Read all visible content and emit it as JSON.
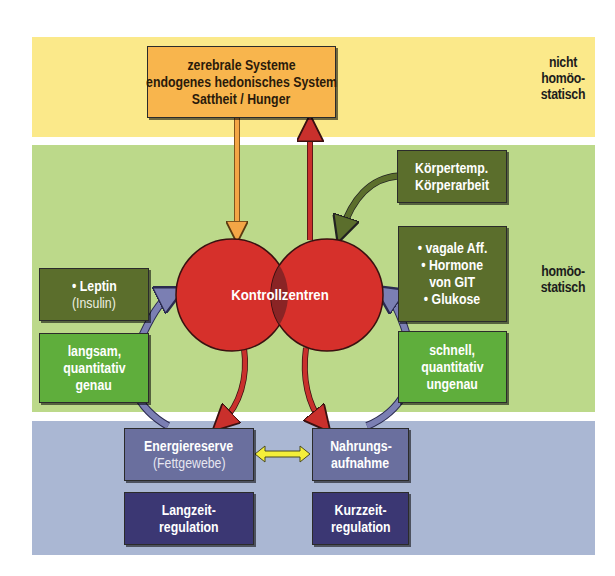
{
  "bands": {
    "top": {
      "label_lines": [
        "nicht",
        "homöo-",
        "statisch"
      ],
      "color": "#fbe98a"
    },
    "middle": {
      "label_lines": [
        "homöo-",
        "statisch"
      ],
      "color": "#bcd98a"
    },
    "bottom": {
      "color": "#aab7d3"
    }
  },
  "boxes": {
    "cerebral": {
      "lines": [
        "zerebrale Systeme",
        "endogenes hedonisches System",
        "Sattheit / Hunger"
      ],
      "color": "#f8b54d"
    },
    "body": {
      "lines": [
        "Körpertemp.",
        "Körperarbeit"
      ],
      "color": "#5b6e2c"
    },
    "gut_signals": {
      "lines": [
        "• vagale Aff.",
        "• Hormone",
        "von GIT",
        "• Glukose"
      ],
      "color": "#5b6e2c"
    },
    "leptin": {
      "lines": [
        "• Leptin",
        "(Insulin)"
      ],
      "color": "#5b6e2c"
    },
    "slow": {
      "lines": [
        "langsam,",
        "quantitativ",
        "genau"
      ],
      "color": "#5fae3c"
    },
    "fast": {
      "lines": [
        "schnell,",
        "quantitativ",
        "ungenau"
      ],
      "color": "#5fae3c"
    },
    "energy_reserve": {
      "lines": [
        "Energiereserve",
        "(Fettgewebe)"
      ],
      "color": "#6a6f9e"
    },
    "food_intake": {
      "lines": [
        "Nahrungs-",
        "aufnahme"
      ],
      "color": "#6a6f9e"
    },
    "long_term": {
      "lines": [
        "Langzeit-",
        "regulation"
      ],
      "color": "#3b3773"
    },
    "short_term": {
      "lines": [
        "Kurzzeit-",
        "regulation"
      ],
      "color": "#3b3773"
    }
  },
  "center": {
    "label": "Kontrollzentren",
    "color": "#d6302b",
    "overlap_color": "#8a2425"
  },
  "arrows": {
    "orange": "#f4a646",
    "red": "#c9302c",
    "olive": "#5b6e2c",
    "purple": "#7b7fb3",
    "yellow": "#f4ee3a"
  }
}
